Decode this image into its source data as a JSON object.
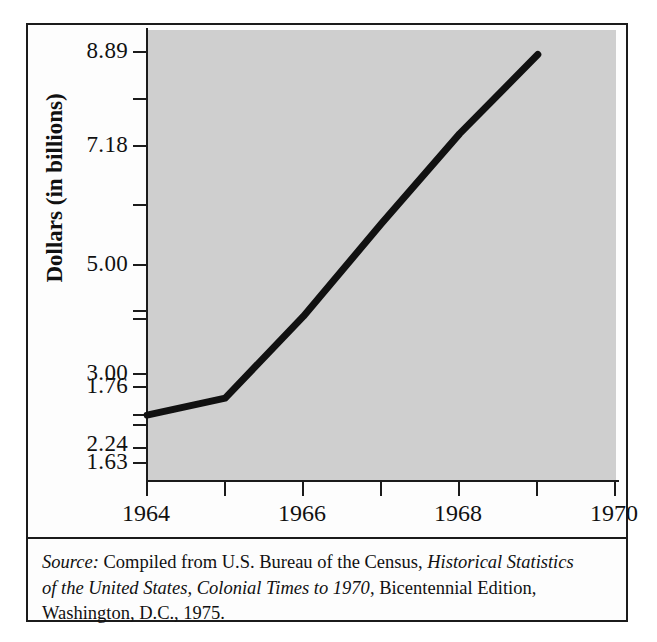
{
  "chart_data": {
    "type": "line",
    "title": "",
    "xlabel": "",
    "ylabel": "Dollars (in billions)",
    "x": [
      1964,
      1965,
      1966,
      1967,
      1968,
      1969
    ],
    "values": [
      2.24,
      2.55,
      4.05,
      5.75,
      7.4,
      8.85
    ],
    "series": [
      {
        "name": "Dollars (in billions)",
        "values": [
          2.24,
          2.55,
          4.05,
          5.75,
          7.4,
          8.85
        ]
      }
    ],
    "xlim": [
      1964,
      1970
    ],
    "ylim": [
      1.05,
      9.3
    ],
    "x_tick_labels": [
      "1964",
      "",
      "1966",
      "",
      "1968",
      "",
      "1970"
    ],
    "x_ticks": [
      1964,
      1965,
      1966,
      1967,
      1968,
      1969,
      1970
    ],
    "y_tick_labels": [
      "8.89",
      "",
      "7.18",
      "",
      "5.00",
      "",
      "3.00",
      "",
      "2.24",
      "",
      "1.76",
      "",
      "1.63"
    ],
    "y_tick_values": [
      8.89,
      8.04,
      7.18,
      6.09,
      5.0,
      4.0,
      3.0,
      2.62,
      2.24,
      2.0,
      1.76,
      1.7,
      1.63
    ],
    "grid": false,
    "legend": "none",
    "plot_bg_color": "#cfcfcf",
    "line_color": "#111111",
    "frame_color": "#1b1b1b"
  },
  "axes": {
    "y_title": "Dollars (in billions)",
    "y_labels": [
      {
        "text": "8.89",
        "value": 8.89,
        "major": true
      },
      {
        "text": "",
        "value": 8.04,
        "major": false
      },
      {
        "text": "7.18",
        "value": 7.18,
        "major": true
      },
      {
        "text": "",
        "value": 6.09,
        "major": false
      },
      {
        "text": "5.00",
        "value": 5.0,
        "major": true
      },
      {
        "text": "",
        "value": 4.0,
        "major": false
      },
      {
        "text": "3.00",
        "value": 3.0,
        "major": true
      },
      {
        "text": "",
        "value": 2.62,
        "major": false
      },
      {
        "text": "2.24",
        "value": 2.24,
        "major": true
      },
      {
        "text": "",
        "value": 2.0,
        "major": false
      },
      {
        "text": "1.76",
        "value": 1.76,
        "major": true
      },
      {
        "text": "",
        "value": 1.7,
        "major": false
      },
      {
        "text": "1.63",
        "value": 1.63,
        "major": true
      }
    ],
    "x_labels": [
      {
        "text": "1964",
        "value": 1964
      },
      {
        "text": "",
        "value": 1965
      },
      {
        "text": "1966",
        "value": 1966
      },
      {
        "text": "",
        "value": 1967
      },
      {
        "text": "1968",
        "value": 1968
      },
      {
        "text": "",
        "value": 1969
      },
      {
        "text": "1970",
        "value": 1970
      }
    ]
  },
  "source": {
    "label": "Source:",
    "line1_plain_a": " Compiled from U.S. Bureau of the Census, ",
    "line1_italic": "Historical Statistics",
    "line2_italic": "of the United States, Colonial Times to 1970",
    "line2_plain": ", Bicentennial Edition,",
    "line3_plain": "Washington, D.C., 1975."
  }
}
